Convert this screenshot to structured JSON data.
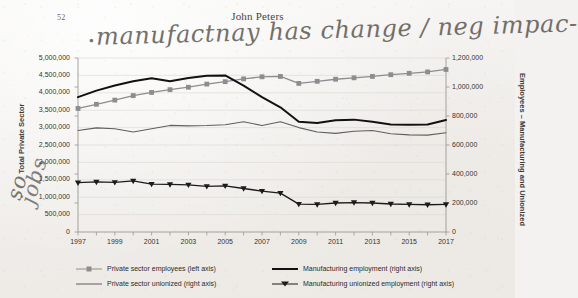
{
  "page": {
    "number": "52",
    "title": "John Peters"
  },
  "annotations": {
    "top_note": "manufactnay has change / neg impac-",
    "top_bullet": "•",
    "left_note_1": "so",
    "left_note_2": "jobs"
  },
  "chart_data": {
    "type": "line",
    "title": "",
    "xlabel": "",
    "ylabel": "Total Private Sector",
    "y2label": "Employees – Manufacturing and Unionized",
    "grid": true,
    "legend_position": "bottom",
    "x": [
      1997,
      1998,
      1999,
      2000,
      2001,
      2002,
      2003,
      2004,
      2005,
      2006,
      2007,
      2008,
      2009,
      2010,
      2011,
      2012,
      2013,
      2014,
      2015,
      2016,
      2017
    ],
    "xlim": [
      1997,
      2017
    ],
    "ylim": [
      0,
      5000000
    ],
    "y2lim": [
      0,
      1200000
    ],
    "ytick_labels": [
      "5,000,000",
      "4,500,000",
      "4,000,000",
      "3,500,000",
      "3,000,000",
      "2,500,000",
      "2,000,000",
      "1,500,000",
      "1,000,000",
      "500,000",
      "0"
    ],
    "y2tick_labels": [
      "1,200,000",
      "1,000,000",
      "800,000",
      "600,000",
      "400,000",
      "200,000",
      "0"
    ],
    "xtick_labels": [
      "1997",
      "1999",
      "2001",
      "2003",
      "2005",
      "2007",
      "2009",
      "2011",
      "2013",
      "2015",
      "2017"
    ],
    "series": [
      {
        "name": "Private sector employees (left axis)",
        "axis": "left",
        "color": "#8d8d8d",
        "marker": "square",
        "values": [
          3550000,
          3670000,
          3790000,
          3920000,
          4010000,
          4090000,
          4160000,
          4250000,
          4320000,
          4400000,
          4460000,
          4470000,
          4270000,
          4330000,
          4390000,
          4430000,
          4470000,
          4520000,
          4560000,
          4600000,
          4670000
        ]
      },
      {
        "name": "Private sector unionized (right axis)",
        "axis": "right",
        "color": "#5f5f5f",
        "marker": "none",
        "values": [
          700000,
          718000,
          712000,
          690000,
          712000,
          735000,
          732000,
          734000,
          740000,
          760000,
          735000,
          760000,
          720000,
          690000,
          680000,
          695000,
          700000,
          678000,
          670000,
          668000,
          685000
        ]
      },
      {
        "name": "Manufacturing employment (right axis)",
        "axis": "right",
        "color": "#111111",
        "marker": "none",
        "values": [
          930000,
          975000,
          1010000,
          1040000,
          1060000,
          1040000,
          1062000,
          1078000,
          1080000,
          1010000,
          930000,
          860000,
          760000,
          752000,
          770000,
          775000,
          760000,
          742000,
          740000,
          742000,
          772000
        ]
      },
      {
        "name": "Manufacturing unionized employment (right axis)",
        "axis": "right",
        "color": "#1b1b1b",
        "marker": "triangle-down",
        "values": [
          340000,
          345000,
          342000,
          352000,
          330000,
          328000,
          325000,
          315000,
          318000,
          300000,
          282000,
          268000,
          192000,
          190000,
          200000,
          203000,
          200000,
          193000,
          190000,
          188000,
          190000
        ]
      }
    ]
  },
  "colors": {
    "gray_series": "#8d8d8d",
    "black_series": "#111111",
    "thin_gray_series": "#5f5f5f",
    "grid": "#d8d6d2",
    "axis": "#9b9893"
  }
}
